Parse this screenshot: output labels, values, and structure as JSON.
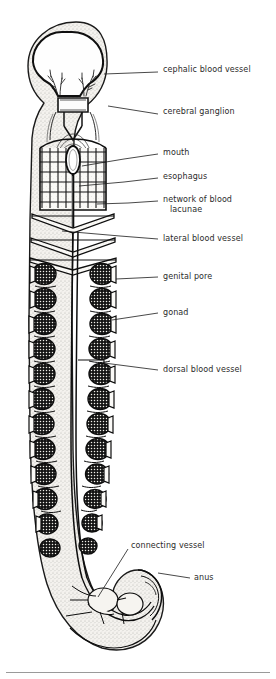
{
  "figure": {
    "organism_outline_color": "#1a1a1a",
    "body_fill_color": "#f2f0ec",
    "stipple_color": "#5a5a5a",
    "gonad_fill_color": "#1e1e1e",
    "background_color": "#ffffff",
    "label_text_color": "#2b2b2b",
    "leader_line_color": "#1a1a1a"
  },
  "labels": [
    {
      "id": "cephalic-blood-vessel",
      "text": "cephalic blood vessel",
      "x": 163,
      "y": 70
    },
    {
      "id": "cerebral-ganglion",
      "text": "cerebral ganglion",
      "x": 163,
      "y": 112
    },
    {
      "id": "mouth",
      "text": "mouth",
      "x": 163,
      "y": 152
    },
    {
      "id": "esophagus",
      "text": "esophagus",
      "x": 163,
      "y": 175
    },
    {
      "id": "network-of-blood-lacunae",
      "text": "network of blood",
      "x": 163,
      "y": 199
    },
    {
      "id": "network-of-blood-lacunae-line2",
      "text": "lacunae",
      "x": 170,
      "y": 209
    },
    {
      "id": "lateral-blood-vessel",
      "text": "lateral blood vessel",
      "x": 163,
      "y": 237
    },
    {
      "id": "genital-pore",
      "text": "genital pore",
      "x": 163,
      "y": 275
    },
    {
      "id": "gonad",
      "text": "gonad",
      "x": 163,
      "y": 311
    },
    {
      "id": "dorsal-blood-vessel",
      "text": "dorsal blood vessel",
      "x": 163,
      "y": 368
    },
    {
      "id": "connecting-vessel",
      "text": "connecting vessel",
      "x": 131,
      "y": 544
    },
    {
      "id": "anus",
      "text": "anus",
      "x": 194,
      "y": 576
    }
  ],
  "leader_lines": [
    {
      "id": "leader-cephalic-blood-vessel",
      "points": "113,72 158,72"
    },
    {
      "id": "leader-cerebral-ganglion",
      "points": "110,106 158,114"
    },
    {
      "id": "leader-mouth",
      "points": "82,167 118,160 158,154"
    },
    {
      "id": "leader-esophagus",
      "points": "79,186 118,182 158,178"
    },
    {
      "id": "leader-network-lacunae",
      "points": "96,205 124,203 158,201"
    },
    {
      "id": "leader-lateral-blood-vessel",
      "points": "62,230 120,236 158,239"
    },
    {
      "id": "leader-genital-pore",
      "points": "116,280 158,278"
    },
    {
      "id": "leader-gonad",
      "points": "112,320 158,314"
    },
    {
      "id": "leader-dorsal-blood-vessel",
      "points": "104,363 158,370"
    },
    {
      "id": "leader-connecting-vessel",
      "points": "98,596 128,550"
    },
    {
      "id": "leader-anus",
      "points": "160,572 190,578"
    }
  ],
  "anatomy_parts": [
    {
      "id": "proboscis",
      "name": "proboscis / head bulb"
    },
    {
      "id": "cephalic-blood-vessel",
      "name": "cephalic blood vessel"
    },
    {
      "id": "cerebral-ganglion",
      "name": "cerebral ganglion"
    },
    {
      "id": "mouth",
      "name": "mouth"
    },
    {
      "id": "esophagus",
      "name": "esophagus"
    },
    {
      "id": "blood-lacunae-network",
      "name": "network of blood lacunae"
    },
    {
      "id": "lateral-blood-vessel",
      "name": "lateral blood vessel"
    },
    {
      "id": "genital-pore",
      "name": "genital pore"
    },
    {
      "id": "gonad",
      "name": "gonad"
    },
    {
      "id": "dorsal-blood-vessel",
      "name": "dorsal blood vessel"
    },
    {
      "id": "connecting-vessel",
      "name": "connecting vessel"
    },
    {
      "id": "anus",
      "name": "anus"
    }
  ],
  "gonad_rows": {
    "count_per_side": 12,
    "first_row_y": 272,
    "row_spacing": 25,
    "left_x": 44,
    "right_x": 106
  }
}
